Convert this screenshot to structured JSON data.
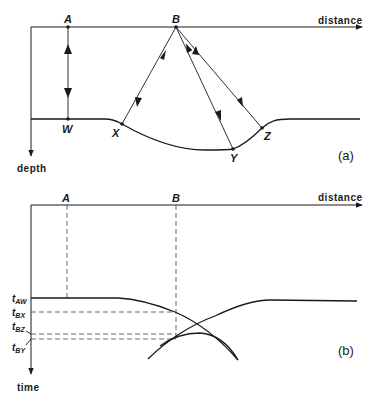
{
  "panel_a": {
    "label": "(a)",
    "x_axis_label": "distance",
    "y_axis_label": "depth",
    "points": {
      "A": "A",
      "B": "B",
      "W": "W",
      "X": "X",
      "Y": "Y",
      "Z": "Z"
    },
    "rays": [
      {
        "from": "A",
        "to": "W",
        "type": "normal-incidence"
      },
      {
        "from": "B",
        "to": "X",
        "type": "reflection"
      },
      {
        "from": "B",
        "to": "Y",
        "type": "reflection"
      },
      {
        "from": "B",
        "to": "Z",
        "type": "reflection"
      }
    ],
    "reflector": "flat interface with a synclinal depression between X and Z"
  },
  "panel_b": {
    "label": "(b)",
    "x_axis_label": "distance",
    "y_axis_label": "time",
    "points": {
      "A": "A",
      "B": "B"
    },
    "time_labels": [
      {
        "main": "t",
        "sub": "AW"
      },
      {
        "main": "t",
        "sub": "BX"
      },
      {
        "main": "t",
        "sub": "BZ"
      },
      {
        "main": "t",
        "sub": "BY"
      }
    ],
    "description": "time section showing bow-tie of crossing reflections beneath syncline"
  },
  "colors": {
    "line": "#1a1a1a",
    "dashed": "#444444",
    "background": "#ffffff"
  }
}
